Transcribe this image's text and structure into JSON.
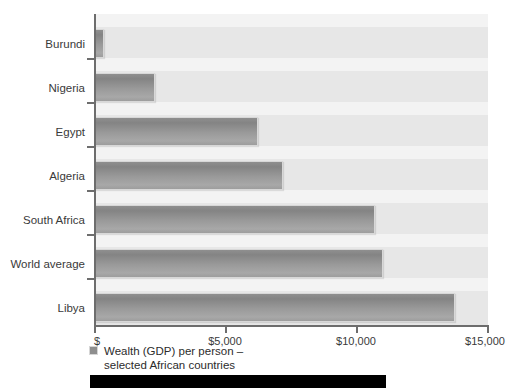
{
  "chart_data": {
    "type": "bar",
    "orientation": "horizontal",
    "title": "",
    "subtitle": "",
    "xlabel": "",
    "ylabel": "",
    "categories": [
      "Burundi",
      "Nigeria",
      "Egypt",
      "Algeria",
      "South Africa",
      "World average",
      "Libya"
    ],
    "values": [
      325,
      2290,
      6220,
      7180,
      10690,
      11000,
      13740
    ],
    "xlim": [
      0,
      15000
    ],
    "xticks": [
      0,
      5000,
      10000,
      15000
    ],
    "xtick_labels": [
      "$",
      "$5,000",
      "$10,000",
      "$15,000"
    ],
    "grid": false,
    "legend_position": "bottom-left",
    "series": [
      {
        "name": "Wealth (GDP) per person – selected African countries",
        "values": [
          325,
          2290,
          6220,
          7180,
          10690,
          11000,
          13740
        ]
      }
    ],
    "legend": [
      {
        "line1": "Wealth (GDP) per person –",
        "line2": "selected African countries",
        "swatch_color": "#8e8e8e"
      }
    ],
    "colors": {
      "bar_fill": "#9a9a9a",
      "bar_border": "#d8d8d8",
      "plot_background": "#ececec",
      "axis": "#6d6d6d",
      "text": "#3a3a3a",
      "footer_bar": "#000000"
    }
  },
  "footer": {
    "bar_label": ""
  }
}
